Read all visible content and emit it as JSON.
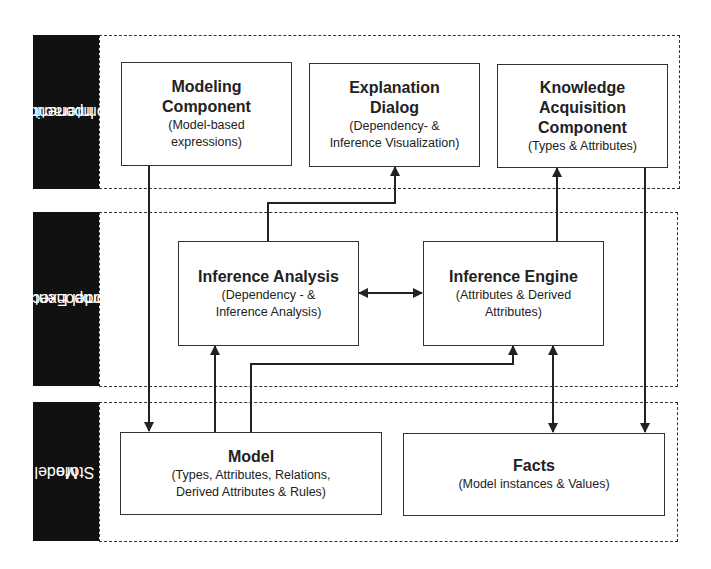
{
  "bands": [
    {
      "id": "interaction",
      "label_lines": [
        "Interaction",
        "Component"
      ]
    },
    {
      "id": "execution",
      "label_lines": [
        "Model Execution",
        "Component"
      ]
    },
    {
      "id": "store",
      "label_lines": [
        "Model",
        "Store"
      ]
    }
  ],
  "boxes": {
    "modeling": {
      "title": "Modeling Component",
      "title_lines": [
        "Modeling",
        "Component"
      ],
      "sub_lines": [
        "(Model-based",
        "expressions)"
      ]
    },
    "explanation": {
      "title": "Explanation Dialog",
      "title_lines": [
        "Explanation",
        "Dialog"
      ],
      "sub_lines": [
        "(Dependency- &",
        "Inference Visualization)"
      ]
    },
    "knowledge": {
      "title": "Knowledge Acquisition Component",
      "title_lines": [
        "Knowledge",
        "Acquisition",
        "Component"
      ],
      "sub_lines": [
        "(Types & Attributes)"
      ]
    },
    "inference_analysis": {
      "title": "Inference Analysis",
      "title_lines": [
        "Inference Analysis"
      ],
      "sub_lines": [
        "(Dependency - &",
        "Inference Analysis)"
      ]
    },
    "inference_engine": {
      "title": "Inference Engine",
      "title_lines": [
        "Inference Engine"
      ],
      "sub_lines": [
        "(Attributes & Derived",
        "Attributes)"
      ]
    },
    "model": {
      "title": "Model",
      "title_lines": [
        "Model"
      ],
      "sub_lines": [
        "(Types, Attributes, Relations,",
        "Derived Attributes & Rules)"
      ]
    },
    "facts": {
      "title": "Facts",
      "title_lines": [
        "Facts"
      ],
      "sub_lines": [
        "(Model instances & Values)"
      ]
    }
  },
  "connections": [
    {
      "from": "modeling",
      "to": "model",
      "type": "arrow"
    },
    {
      "from": "inference_analysis",
      "to": "explanation",
      "type": "arrow"
    },
    {
      "from": "inference_analysis",
      "to": "inference_engine",
      "type": "bidirectional"
    },
    {
      "from": "inference_engine",
      "to": "knowledge",
      "type": "arrow"
    },
    {
      "from": "knowledge",
      "to": "facts",
      "type": "arrow"
    },
    {
      "from": "model",
      "to": "inference_analysis",
      "type": "arrow"
    },
    {
      "from": "model",
      "to": "inference_engine",
      "type": "arrow"
    },
    {
      "from": "facts",
      "to": "inference_engine",
      "type": "bidirectional"
    }
  ]
}
